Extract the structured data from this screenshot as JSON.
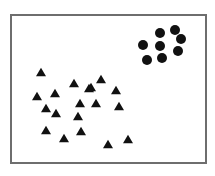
{
  "diagram": {
    "frame": {
      "x": 10,
      "y": 14,
      "width": 196,
      "height": 149,
      "border_color": "#6e6e6e"
    },
    "marker_color": "#111111",
    "circle_radius": 5,
    "triangle_size": 10,
    "circles": [
      [
        160,
        33
      ],
      [
        175,
        30
      ],
      [
        181,
        39
      ],
      [
        143,
        45
      ],
      [
        160,
        46
      ],
      [
        178,
        51
      ],
      [
        147,
        60
      ],
      [
        162,
        58
      ]
    ],
    "triangles": [
      [
        41,
        72
      ],
      [
        74,
        83
      ],
      [
        89,
        88
      ],
      [
        101,
        79
      ],
      [
        91,
        87
      ],
      [
        116,
        90
      ],
      [
        37,
        96
      ],
      [
        55,
        93
      ],
      [
        80,
        103
      ],
      [
        96,
        103
      ],
      [
        119,
        106
      ],
      [
        46,
        108
      ],
      [
        56,
        113
      ],
      [
        78,
        116
      ],
      [
        46,
        130
      ],
      [
        64,
        138
      ],
      [
        81,
        131
      ],
      [
        108,
        144
      ],
      [
        128,
        139
      ]
    ]
  },
  "chart_data": {
    "type": "scatter",
    "title": "",
    "xlabel": "",
    "ylabel": "",
    "grid": false,
    "series": [
      {
        "name": "circles",
        "marker": "circle",
        "count": 8,
        "points": [
          [
            160,
            33
          ],
          [
            175,
            30
          ],
          [
            181,
            39
          ],
          [
            143,
            45
          ],
          [
            160,
            46
          ],
          [
            178,
            51
          ],
          [
            147,
            60
          ],
          [
            162,
            58
          ]
        ]
      },
      {
        "name": "triangles",
        "marker": "triangle",
        "count": 19,
        "points": [
          [
            41,
            72
          ],
          [
            74,
            83
          ],
          [
            89,
            88
          ],
          [
            101,
            79
          ],
          [
            91,
            87
          ],
          [
            116,
            90
          ],
          [
            37,
            96
          ],
          [
            55,
            93
          ],
          [
            80,
            103
          ],
          [
            96,
            103
          ],
          [
            119,
            106
          ],
          [
            46,
            108
          ],
          [
            56,
            113
          ],
          [
            78,
            116
          ],
          [
            46,
            130
          ],
          [
            64,
            138
          ],
          [
            81,
            131
          ],
          [
            108,
            144
          ],
          [
            128,
            139
          ]
        ]
      }
    ]
  }
}
